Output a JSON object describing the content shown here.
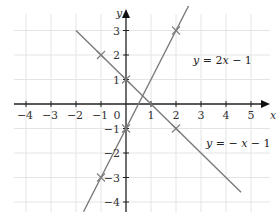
{
  "chart_data": {
    "type": "line",
    "title": "",
    "xlabel": "x",
    "ylabel": "y",
    "xlim": [
      -4,
      5
    ],
    "ylim": [
      -4,
      3
    ],
    "grid": true,
    "origin_label": "0",
    "x_ticks": [
      "-4",
      "-3",
      "-2",
      "-1",
      "1",
      "2",
      "3",
      "4",
      "5"
    ],
    "y_ticks": [
      "3",
      "2",
      "1",
      "-1",
      "-2",
      "-3",
      "-4"
    ],
    "series": [
      {
        "name": "y = 2x − 1",
        "label_parts": [
          "y",
          " = 2",
          "x",
          " − 1"
        ],
        "equation": "y = 2x - 1",
        "slope": 2,
        "intercept": -1,
        "x_range": [
          -1.7,
          2.5
        ],
        "marked_points": [
          [
            -1,
            -3
          ],
          [
            0,
            -1
          ],
          [
            2,
            3
          ]
        ],
        "color": "#7a7a7a"
      },
      {
        "name": "y = − x − 1",
        "label_parts": [
          "y",
          " = − ",
          "x",
          " − 1"
        ],
        "equation": "y = -x - 1",
        "plotted_slope": -1,
        "plotted_intercept": 1,
        "x_range": [
          -2,
          4.6
        ],
        "marked_points": [
          [
            -1,
            2
          ],
          [
            0,
            1
          ],
          [
            2,
            -1
          ]
        ],
        "color": "#7a7a7a"
      }
    ]
  }
}
